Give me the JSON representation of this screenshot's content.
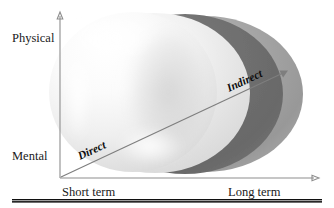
{
  "figure": {
    "kind": "conceptual-diagram",
    "background_color": "#ffffff"
  },
  "axes": {
    "y_top_label": "Physical",
    "y_bottom_label": "Mental",
    "x_left_label": "Short term",
    "x_right_label": "Long term",
    "axis_color": "#8d8d8d",
    "origin": {
      "x": 60,
      "y": 178
    },
    "y_tip": {
      "x": 60,
      "y": 14
    },
    "x_tip": {
      "x": 318,
      "y": 178
    }
  },
  "flow_arrow": {
    "start_label": "Direct",
    "end_label": "Indirect",
    "color": "#7e7e7e",
    "start": {
      "x": 61,
      "y": 177
    },
    "end": {
      "x": 287,
      "y": 71
    }
  },
  "shapes": {
    "outer_shell": {
      "name": "outer-light-gray-sphere",
      "color": "#9c9c9c"
    },
    "middle_shell": {
      "name": "middle-dark-gray-sphere",
      "color": "#6e6e6e"
    },
    "inner_shell": {
      "name": "inner-white-sphere",
      "color": "#f3f3f3"
    },
    "front_sphere": {
      "name": "front-white-sphere",
      "color": "#fbfbfb"
    }
  },
  "rule": {
    "name": "bottom-rule",
    "color": "#101010"
  }
}
